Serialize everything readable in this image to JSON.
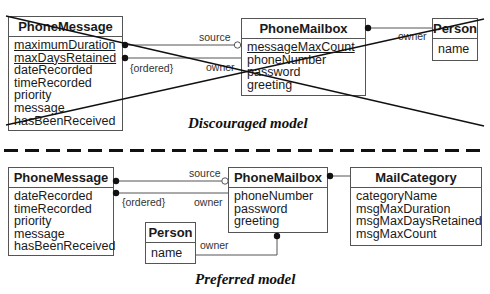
{
  "discouraged": {
    "caption": "Discouraged model",
    "phone_message": {
      "name": "PhoneMessage",
      "attributes": [
        {
          "name": "maximumDuration",
          "static": true
        },
        {
          "name": "maxDaysRetained",
          "static": true
        },
        {
          "name": "dateRecorded",
          "static": false
        },
        {
          "name": "timeRecorded",
          "static": false
        },
        {
          "name": "priority",
          "static": false
        },
        {
          "name": "message",
          "static": false
        },
        {
          "name": "hasBeenReceived",
          "static": false
        }
      ]
    },
    "phone_mailbox": {
      "name": "PhoneMailbox",
      "attributes": [
        {
          "name": "messageMaxCount",
          "static": true
        },
        {
          "name": "phoneNumber",
          "static": false
        },
        {
          "name": "password",
          "static": false
        },
        {
          "name": "greeting",
          "static": false
        }
      ]
    },
    "person": {
      "name": "Person",
      "attributes": [
        {
          "name": "name",
          "static": false
        }
      ]
    },
    "labels": {
      "source": "source",
      "ordered": "{ordered}",
      "owner_message": "owner",
      "owner_person": "owner"
    }
  },
  "preferred": {
    "caption": "Preferred model",
    "phone_message": {
      "name": "PhoneMessage",
      "attributes": [
        {
          "name": "dateRecorded"
        },
        {
          "name": "timeRecorded"
        },
        {
          "name": "priority"
        },
        {
          "name": "message"
        },
        {
          "name": "hasBeenReceived"
        }
      ]
    },
    "phone_mailbox": {
      "name": "PhoneMailbox",
      "attributes": [
        {
          "name": "phoneNumber"
        },
        {
          "name": "password"
        },
        {
          "name": "greeting"
        }
      ]
    },
    "person": {
      "name": "Person",
      "attributes": [
        {
          "name": "name"
        }
      ]
    },
    "mail_category": {
      "name": "MailCategory",
      "attributes": [
        {
          "name": "categoryName"
        },
        {
          "name": "msgMaxDuration"
        },
        {
          "name": "msgMaxDaysRetained"
        },
        {
          "name": "msgMaxCount"
        }
      ]
    },
    "labels": {
      "source": "source",
      "ordered": "{ordered}",
      "owner_message": "owner",
      "owner_person": "owner"
    }
  },
  "colors": {
    "line": "#555555",
    "cross": "#111111",
    "text": "#1a1a1a"
  }
}
